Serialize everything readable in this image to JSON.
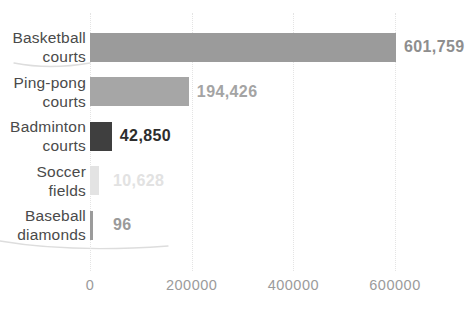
{
  "chart_data": {
    "type": "bar",
    "orientation": "horizontal",
    "title": "",
    "xlabel": "",
    "ylabel": "",
    "categories": [
      "Basketball courts",
      "Ping-pong courts",
      "Badminton courts",
      "Soccer fields",
      "Baseball diamonds"
    ],
    "values": [
      601759,
      194426,
      42850,
      10628,
      96
    ],
    "rows": [
      {
        "label_lines": [
          "Basketball",
          "courts"
        ],
        "value": 601759,
        "value_label": "601,759",
        "bar_color": "#9b9b9b",
        "value_color": "#8e8e8e"
      },
      {
        "label_lines": [
          "Ping-pong",
          "courts"
        ],
        "value": 194426,
        "value_label": "194,426",
        "bar_color": "#a6a6a6",
        "value_color": "#a4a4a4"
      },
      {
        "label_lines": [
          "Badminton",
          "courts"
        ],
        "value": 42850,
        "value_label": "42,850",
        "bar_color": "#3f3f3f",
        "value_color": "#2d2d2d"
      },
      {
        "label_lines": [
          "Soccer",
          "fields"
        ],
        "value": 10628,
        "value_label": "10,628",
        "bar_color": "#e3e3e3",
        "value_color": "#e2e2e2"
      },
      {
        "label_lines": [
          "Baseball",
          "diamonds"
        ],
        "value": 96,
        "value_label": "96",
        "bar_color": "#9b9b9b",
        "value_color": "#9a9a9a"
      }
    ],
    "xlim": [
      0,
      600000
    ],
    "x_ticks": [
      {
        "value": 0,
        "label": "0"
      },
      {
        "value": 200000,
        "label": "200000"
      },
      {
        "value": 400000,
        "label": "400000"
      },
      {
        "value": 600000,
        "label": "600000"
      }
    ],
    "grid": "vertical-dotted",
    "legend_position": "none",
    "colors": {
      "category_label": "#4a4a4a",
      "tick_label": "#9b9b9b",
      "gridline": "#e4e4e4",
      "background": "#ffffff",
      "artifact_line": "#dddddd"
    }
  }
}
